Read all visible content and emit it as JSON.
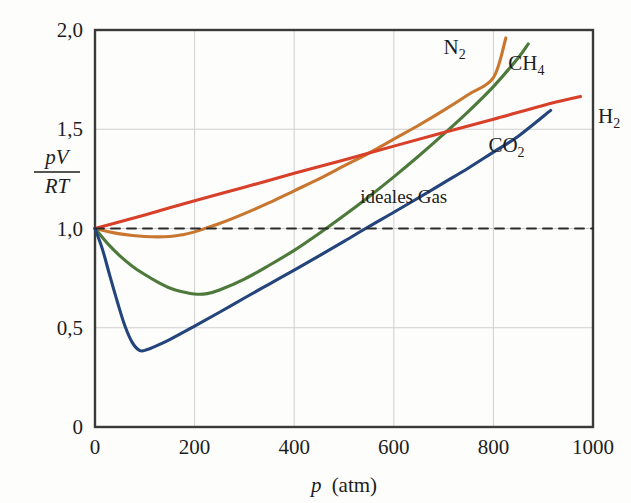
{
  "chart_data": {
    "type": "line",
    "title": "",
    "xlabel": "p (atm)",
    "xlabel_symbol": "p",
    "xlabel_unit": "(atm)",
    "ylabel": "pV/RT",
    "ylabel_numerator": "pV",
    "ylabel_denominator": "RT",
    "xlim": [
      0,
      1000
    ],
    "ylim": [
      0,
      2.0
    ],
    "grid": true,
    "legend_position": "inline-labels",
    "xticks": [
      0,
      200,
      400,
      600,
      800,
      1000
    ],
    "xtick_labels": [
      "0",
      "200",
      "400",
      "600",
      "800",
      "1000"
    ],
    "yticks": [
      0,
      0.5,
      1.0,
      1.5,
      2.0
    ],
    "ytick_labels": [
      "0",
      "0,5",
      "1,0",
      "1,5",
      "2,0"
    ],
    "annotations": [
      {
        "text": "ideales Gas",
        "x": 620,
        "y": 1.13
      }
    ],
    "series": [
      {
        "name": "N2",
        "label": "N",
        "sub": "2",
        "color": "#c9762f",
        "style": "solid",
        "label_x": 700,
        "label_y": 1.88,
        "x": [
          0,
          25,
          50,
          75,
          100,
          125,
          150,
          175,
          200,
          250,
          300,
          350,
          400,
          450,
          500,
          550,
          600,
          650,
          700,
          750,
          800,
          825
        ],
        "y": [
          1.0,
          0.985,
          0.973,
          0.965,
          0.96,
          0.958,
          0.96,
          0.968,
          0.983,
          1.025,
          1.075,
          1.13,
          1.19,
          1.25,
          1.315,
          1.38,
          1.45,
          1.52,
          1.595,
          1.675,
          1.76,
          1.96
        ]
      },
      {
        "name": "CH4",
        "label": "CH",
        "sub": "4",
        "color": "#4d7a3b",
        "style": "solid",
        "label_x": 830,
        "label_y": 1.8,
        "x": [
          0,
          25,
          50,
          75,
          100,
          125,
          150,
          175,
          200,
          225,
          250,
          300,
          350,
          400,
          450,
          500,
          550,
          600,
          650,
          700,
          750,
          800,
          850,
          870
        ],
        "y": [
          1.0,
          0.925,
          0.862,
          0.81,
          0.768,
          0.731,
          0.7,
          0.681,
          0.67,
          0.672,
          0.69,
          0.745,
          0.815,
          0.89,
          0.975,
          1.065,
          1.16,
          1.26,
          1.365,
          1.475,
          1.59,
          1.715,
          1.86,
          1.93
        ]
      },
      {
        "name": "H2",
        "label": "H",
        "sub": "2",
        "color": "#d8402a",
        "style": "solid",
        "label_x": 1010,
        "label_y": 1.53,
        "x": [
          0,
          100,
          200,
          300,
          400,
          500,
          600,
          700,
          800,
          900,
          975
        ],
        "y": [
          1.0,
          1.068,
          1.14,
          1.208,
          1.278,
          1.345,
          1.415,
          1.483,
          1.55,
          1.62,
          1.665
        ]
      },
      {
        "name": "CO2",
        "label": "CO",
        "sub": "2",
        "color": "#23457c",
        "style": "solid",
        "label_x": 790,
        "label_y": 1.385,
        "x": [
          0,
          15,
          30,
          45,
          60,
          75,
          90,
          105,
          120,
          150,
          200,
          250,
          300,
          350,
          400,
          450,
          500,
          550,
          600,
          650,
          700,
          750,
          800,
          850,
          915
        ],
        "y": [
          1.0,
          0.895,
          0.76,
          0.63,
          0.51,
          0.425,
          0.385,
          0.39,
          0.405,
          0.44,
          0.508,
          0.578,
          0.65,
          0.72,
          0.79,
          0.862,
          0.935,
          1.01,
          1.082,
          1.155,
          1.23,
          1.305,
          1.385,
          1.465,
          1.595
        ]
      },
      {
        "name": "ideal-gas",
        "label": "ideales Gas",
        "sub": "",
        "color": "#2a2a2a",
        "style": "dashed",
        "label_x": 620,
        "label_y": 1.13,
        "x": [
          0,
          1000
        ],
        "y": [
          1.0,
          1.0
        ]
      }
    ]
  },
  "colors": {
    "axis": "#3a3a3a",
    "grid": "#cfcfcf",
    "background": "#fdfdfc",
    "text": "#1d1d1d"
  }
}
